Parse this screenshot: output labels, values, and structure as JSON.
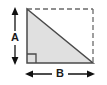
{
  "figure": {
    "kind": "right-triangle-dimension-diagram",
    "background_color": "#ffffff",
    "shape": {
      "name": "right-triangle",
      "fill_color": "#e0e0e0",
      "stroke_color": "#4a4a4a",
      "vertices": [
        {
          "label": "top-left",
          "x": 27,
          "y": 9
        },
        {
          "label": "bottom-left",
          "x": 27,
          "y": 63
        },
        {
          "label": "bottom-right",
          "x": 93,
          "y": 63
        }
      ]
    },
    "completion_rectangle": {
      "name": "dashed-rectangle",
      "stroke_color": "#6b6b6b",
      "dash_pattern": "5 3",
      "edges": [
        "top",
        "right"
      ]
    },
    "right_angle_marker": {
      "name": "right-angle-square",
      "stroke_color": "#4a4a4a",
      "corner": "bottom-left",
      "size": 9
    },
    "dimensions": [
      {
        "id": "height",
        "label": "A",
        "orientation": "vertical",
        "arrow_color": "#111111",
        "axis_x": 15,
        "from": 8,
        "to": 64,
        "label_x": 15,
        "label_y": 38
      },
      {
        "id": "width",
        "label": "B",
        "orientation": "horizontal",
        "arrow_color": "#111111",
        "axis_y": 74,
        "from": 26,
        "to": 94,
        "label_x": 60,
        "label_y": 74
      }
    ]
  }
}
